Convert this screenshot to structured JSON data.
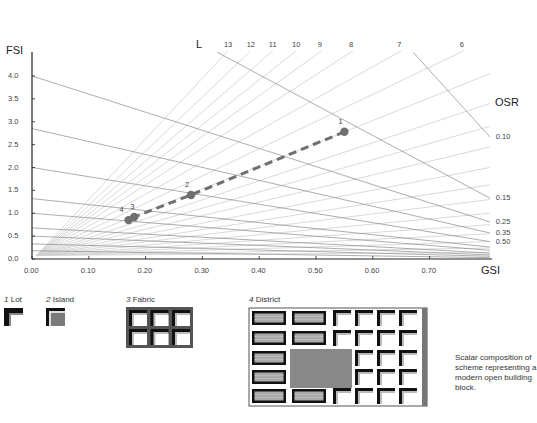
{
  "chart_data": {
    "type": "scatter",
    "title": "",
    "xlabel": "GSI",
    "ylabel": "FSI",
    "xlim": [
      0,
      0.8
    ],
    "ylim": [
      0,
      4.3
    ],
    "x_ticks": [
      "0.00",
      "0.10",
      "0.20",
      "0.30",
      "0.40",
      "0.50",
      "0.60",
      "0.70"
    ],
    "y_ticks": [
      "0.0",
      "0.5",
      "1.0",
      "1.5",
      "2.0",
      "2.5",
      "3.0",
      "3.5",
      "4.0"
    ],
    "grid": false,
    "series": [
      {
        "name": "Scheme scalar composition",
        "style": "dashed line with markers",
        "points": [
          {
            "label": "1",
            "gsi": 0.55,
            "fsi": 2.78
          },
          {
            "label": "2",
            "gsi": 0.28,
            "fsi": 1.4
          },
          {
            "label": "3",
            "gsi": 0.18,
            "fsi": 0.92
          },
          {
            "label": "4",
            "gsi": 0.17,
            "fsi": 0.85
          }
        ]
      }
    ],
    "L_lines": {
      "label": "L",
      "origin": {
        "gsi": 0.008,
        "fsi": 0.08
      },
      "lines": [
        {
          "label": "13",
          "end": {
            "gsi": 0.345,
            "fsi": 4.55
          }
        },
        {
          "label": "12",
          "end": {
            "gsi": 0.385,
            "fsi": 4.55
          }
        },
        {
          "label": "11",
          "end": {
            "gsi": 0.424,
            "fsi": 4.55
          }
        },
        {
          "label": "10",
          "end": {
            "gsi": 0.465,
            "fsi": 4.55
          }
        },
        {
          "label": "9",
          "end": {
            "gsi": 0.51,
            "fsi": 4.55
          }
        },
        {
          "label": "8",
          "end": {
            "gsi": 0.565,
            "fsi": 4.55
          }
        },
        {
          "label": "7",
          "end": {
            "gsi": 0.65,
            "fsi": 4.55
          }
        },
        {
          "label": "6",
          "end": {
            "gsi": 0.76,
            "fsi": 4.55
          }
        },
        {
          "label": "",
          "end": {
            "gsi": 0.806,
            "fsi": 4.05
          }
        },
        {
          "label": "",
          "end": {
            "gsi": 0.806,
            "fsi": 3.4
          }
        },
        {
          "label": "",
          "end": {
            "gsi": 0.806,
            "fsi": 2.9
          }
        },
        {
          "label": "",
          "end": {
            "gsi": 0.806,
            "fsi": 2.45
          }
        },
        {
          "label": "",
          "end": {
            "gsi": 0.806,
            "fsi": 2.0
          }
        },
        {
          "label": "",
          "end": {
            "gsi": 0.806,
            "fsi": 1.62
          }
        },
        {
          "label": "",
          "end": {
            "gsi": 0.806,
            "fsi": 1.3
          }
        },
        {
          "label": "",
          "end": {
            "gsi": 0.806,
            "fsi": 1.0
          }
        },
        {
          "label": "",
          "end": {
            "gsi": 0.806,
            "fsi": 0.75
          }
        },
        {
          "label": "",
          "end": {
            "gsi": 0.806,
            "fsi": 0.55
          }
        },
        {
          "label": "",
          "end": {
            "gsi": 0.806,
            "fsi": 0.38
          }
        },
        {
          "label": "",
          "end": {
            "gsi": 0.806,
            "fsi": 0.24
          }
        },
        {
          "label": "",
          "end": {
            "gsi": 0.806,
            "fsi": 0.14
          }
        }
      ]
    },
    "OSR_lines": {
      "label": "OSR",
      "lines": [
        {
          "label": "0.10",
          "start": {
            "gsi": 0.671,
            "fsi": 4.52
          },
          "end": {
            "gsi": 0.806,
            "fsi": 2.67
          }
        },
        {
          "label": "0.15",
          "start": {
            "gsi": 0.326,
            "fsi": 4.52
          },
          "end": {
            "gsi": 0.806,
            "fsi": 1.33
          }
        },
        {
          "label": "0.25",
          "start": {
            "gsi": 0.0,
            "fsi": 4.0
          },
          "end": {
            "gsi": 0.806,
            "fsi": 0.81
          }
        },
        {
          "label": "0.35",
          "start": {
            "gsi": 0.0,
            "fsi": 2.85
          },
          "end": {
            "gsi": 0.806,
            "fsi": 0.57
          }
        },
        {
          "label": "0.50",
          "start": {
            "gsi": 0.0,
            "fsi": 2.0
          },
          "end": {
            "gsi": 0.806,
            "fsi": 0.38
          }
        },
        {
          "label": "",
          "start": {
            "gsi": 0.0,
            "fsi": 1.32
          },
          "end": {
            "gsi": 0.806,
            "fsi": 0.26
          }
        },
        {
          "label": "",
          "start": {
            "gsi": 0.0,
            "fsi": 1.0
          },
          "end": {
            "gsi": 0.806,
            "fsi": 0.19
          }
        },
        {
          "label": "",
          "start": {
            "gsi": 0.0,
            "fsi": 0.68
          },
          "end": {
            "gsi": 0.806,
            "fsi": 0.13
          }
        },
        {
          "label": "",
          "start": {
            "gsi": 0.0,
            "fsi": 0.5
          },
          "end": {
            "gsi": 0.806,
            "fsi": 0.09
          }
        },
        {
          "label": "",
          "start": {
            "gsi": 0.0,
            "fsi": 0.33
          },
          "end": {
            "gsi": 0.806,
            "fsi": 0.06
          }
        },
        {
          "label": "",
          "start": {
            "gsi": 0.0,
            "fsi": 0.18
          },
          "end": {
            "gsi": 0.806,
            "fsi": 0.03
          }
        }
      ]
    },
    "colors": {
      "axis": "#222222",
      "l_line": "#cfcfcf",
      "osr_line": "#8a8a8a",
      "series": "#707070"
    }
  },
  "legend_panels": {
    "lot": {
      "num": "1",
      "label": "Lot"
    },
    "island": {
      "num": "2",
      "label": "Island"
    },
    "fabric": {
      "num": "3",
      "label": "Fabric"
    },
    "district": {
      "num": "4",
      "label": "District"
    }
  },
  "caption": "Scalar composition of scheme representing a modern open building block."
}
